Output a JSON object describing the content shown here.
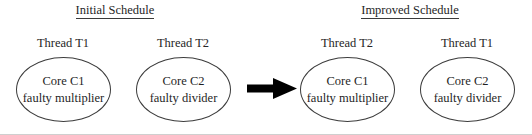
{
  "figure": {
    "background_color": "#ffffff",
    "stroke_color": "#3c3c3c",
    "arrow_color": "#000000",
    "baseline_color": "#cfcfcf"
  },
  "sections": [
    {
      "id": "initial",
      "title": "Initial Schedule",
      "threads": [
        {
          "label": "Thread T1",
          "core": "Core C1",
          "fault": "faulty multiplier"
        },
        {
          "label": "Thread T2",
          "core": "Core C2",
          "fault": "faulty divider"
        }
      ]
    },
    {
      "id": "improved",
      "title": "Improved Schedule",
      "threads": [
        {
          "label": "Thread T2",
          "core": "Core C1",
          "fault": "faulty multiplier"
        },
        {
          "label": "Thread T1",
          "core": "Core C2",
          "fault": "faulty divider"
        }
      ]
    }
  ],
  "arrow": {
    "icon": "right-arrow-icon",
    "direction": "right"
  }
}
